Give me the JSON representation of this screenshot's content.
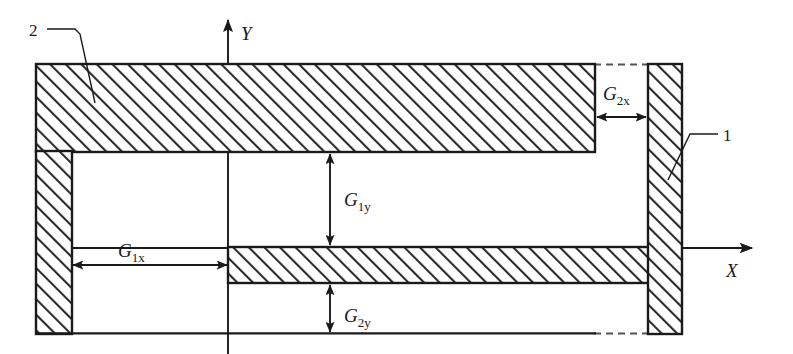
{
  "figure": {
    "type": "engineering-cross-section-diagram",
    "background_color": "#ffffff",
    "line_color": "#1a1a1a",
    "hatch_color": "#2b2b2b"
  },
  "axes": {
    "y_label": "Y",
    "x_label": "X",
    "origin_x_px": 228,
    "origin_y_px": 248
  },
  "part_callouts": [
    {
      "id": "callout-1",
      "label": "1",
      "points_to": "right-vertical-bar"
    },
    {
      "id": "callout-2",
      "label": "2",
      "points_to": "outer-c-frame"
    }
  ],
  "dimensions": [
    {
      "id": "g1x",
      "symbol": "G",
      "subscript": "1x",
      "orientation": "horizontal",
      "from_px": 72,
      "to_px": 228,
      "at_px": 265
    },
    {
      "id": "g2x",
      "symbol": "G",
      "subscript": "2x",
      "orientation": "horizontal",
      "from_px": 595,
      "to_px": 648,
      "at_px": 117
    },
    {
      "id": "g1y",
      "symbol": "G",
      "subscript": "1y",
      "orientation": "vertical",
      "from_px": 152,
      "to_px": 247,
      "at_px": 330
    },
    {
      "id": "g2y",
      "symbol": "G",
      "subscript": "2y",
      "orientation": "vertical",
      "from_px": 283,
      "to_px": 334,
      "at_px": 330
    }
  ],
  "shapes": {
    "top_bar": {
      "x": 36,
      "y": 64,
      "w": 559,
      "h": 88,
      "hatched": true
    },
    "left_bar": {
      "x": 36,
      "y": 152,
      "w": 36,
      "h": 182,
      "hatched": true
    },
    "right_bar": {
      "x": 648,
      "y": 64,
      "w": 34,
      "h": 270,
      "hatched": true
    },
    "middle_bar": {
      "x": 228,
      "y": 247,
      "w": 420,
      "h": 36,
      "hatched": true
    },
    "bottom_outline": {
      "x1": 36,
      "y1": 334,
      "x2": 595,
      "y2": 334,
      "hatched": false
    },
    "dashed_top": {
      "x1": 595,
      "y1": 64,
      "x2": 648,
      "y2": 64
    },
    "dashed_bottom": {
      "x1": 595,
      "y1": 334,
      "x2": 648,
      "y2": 334
    }
  }
}
